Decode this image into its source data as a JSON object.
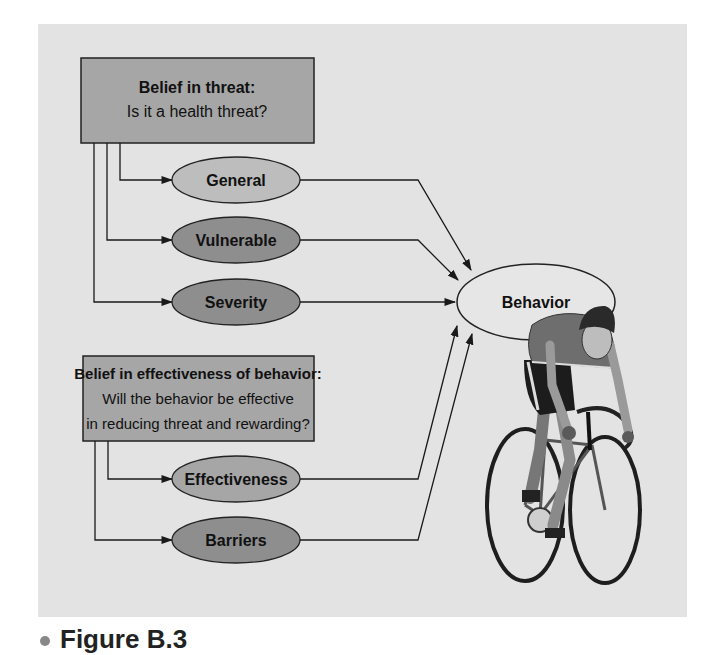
{
  "figure": {
    "caption_label": "Figure B.3",
    "colors": {
      "panel_bg": "#e3e3e3",
      "box_fill": "#a6a6a6",
      "light_ellipse": "#bdbdbd",
      "dark_ellipse": "#8e8e8e",
      "behavior_fill": "#e6e6e6",
      "line": "#1a1a1a"
    }
  },
  "threat_box": {
    "title": "Belief in threat:",
    "subtitle": "Is it a health threat?"
  },
  "threat_factors": [
    {
      "label": "General"
    },
    {
      "label": "Vulnerable"
    },
    {
      "label": "Severity"
    }
  ],
  "effectiveness_box": {
    "title": "Belief in effectiveness of behavior:",
    "line2": "Will the behavior be effective",
    "line3": "in reducing threat and rewarding?"
  },
  "effectiveness_factors": [
    {
      "label": "Effectiveness"
    },
    {
      "label": "Barriers"
    }
  ],
  "outcome": {
    "label": "Behavior"
  },
  "illustration": {
    "description": "cyclist-on-road-bike"
  }
}
